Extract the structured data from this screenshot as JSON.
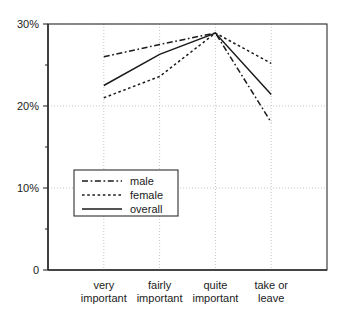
{
  "chart_data": {
    "type": "line",
    "title": "",
    "subtitle": "",
    "xlabel": "",
    "ylabel": "",
    "categories": [
      "very important",
      "fairly important",
      "quite important",
      "take or leave"
    ],
    "category_lines": [
      [
        "very",
        "important"
      ],
      [
        "fairly",
        "important"
      ],
      [
        "quite",
        "important"
      ],
      [
        "take or",
        "leave"
      ]
    ],
    "series": [
      {
        "name": "male",
        "style": "dash-dot",
        "values": [
          26.0,
          27.5,
          28.9,
          18.0
        ]
      },
      {
        "name": "female",
        "style": "dotted",
        "values": [
          21.0,
          23.6,
          28.9,
          25.2
        ]
      },
      {
        "name": "overall",
        "style": "solid",
        "values": [
          22.5,
          26.3,
          28.9,
          21.4
        ]
      }
    ],
    "ylim": [
      0,
      30
    ],
    "ytick_values": [
      0,
      10,
      20,
      30
    ],
    "ytick_labels": [
      "0",
      "10%",
      "20%",
      "30%"
    ],
    "yminor_tick_values": [
      5,
      15,
      25
    ],
    "grid": {
      "horizontal": true,
      "vertical": true
    },
    "legend": {
      "position": "inside-lower-left",
      "entries": [
        "male",
        "female",
        "overall"
      ]
    },
    "colors": {
      "line": "#1b1b1b",
      "axis": "#2e2e2e",
      "grid": "#b9b9b9",
      "background": "#ffffff"
    }
  }
}
